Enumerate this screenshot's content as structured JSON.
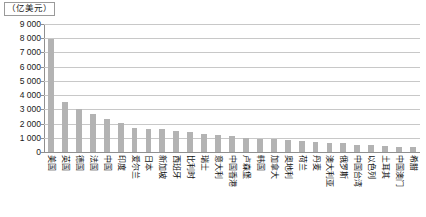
{
  "chart": {
    "unit_caption": "（亿美元）",
    "type": "bar"
  },
  "chart_data": {
    "type": "bar",
    "title": "",
    "subtitle": "",
    "xlabel": "",
    "ylabel": "（亿美元）",
    "ylim": [
      0,
      9000
    ],
    "ytick_labels": [
      "9 000",
      "8 000",
      "7 000",
      "6 000",
      "5 000",
      "4 000",
      "3 000",
      "2 000",
      "1 000",
      "0"
    ],
    "ytick_values": [
      9000,
      8000,
      7000,
      6000,
      5000,
      4000,
      3000,
      2000,
      1000,
      0
    ],
    "grid": true,
    "legend": "none",
    "bar_color": "#b3b3b3",
    "categories": [
      "美国",
      "英国",
      "德国",
      "法国",
      "中国",
      "印度",
      "爱尔兰",
      "日本",
      "新加坡",
      "西班牙",
      "比利时",
      "瑞士",
      "意大利",
      "中国香港",
      "卢森堡",
      "韩国",
      "加拿大",
      "奥地利",
      "荷兰",
      "丹麦",
      "澳大利亚",
      "俄罗斯",
      "中国台湾",
      "以色列",
      "土耳其",
      "中国澳门",
      "希腊"
    ],
    "values": [
      7950,
      3500,
      3000,
      2650,
      2300,
      2050,
      1700,
      1650,
      1600,
      1500,
      1400,
      1300,
      1200,
      1100,
      1000,
      950,
      900,
      850,
      800,
      700,
      650,
      600,
      520,
      470,
      420,
      380,
      330
    ]
  }
}
